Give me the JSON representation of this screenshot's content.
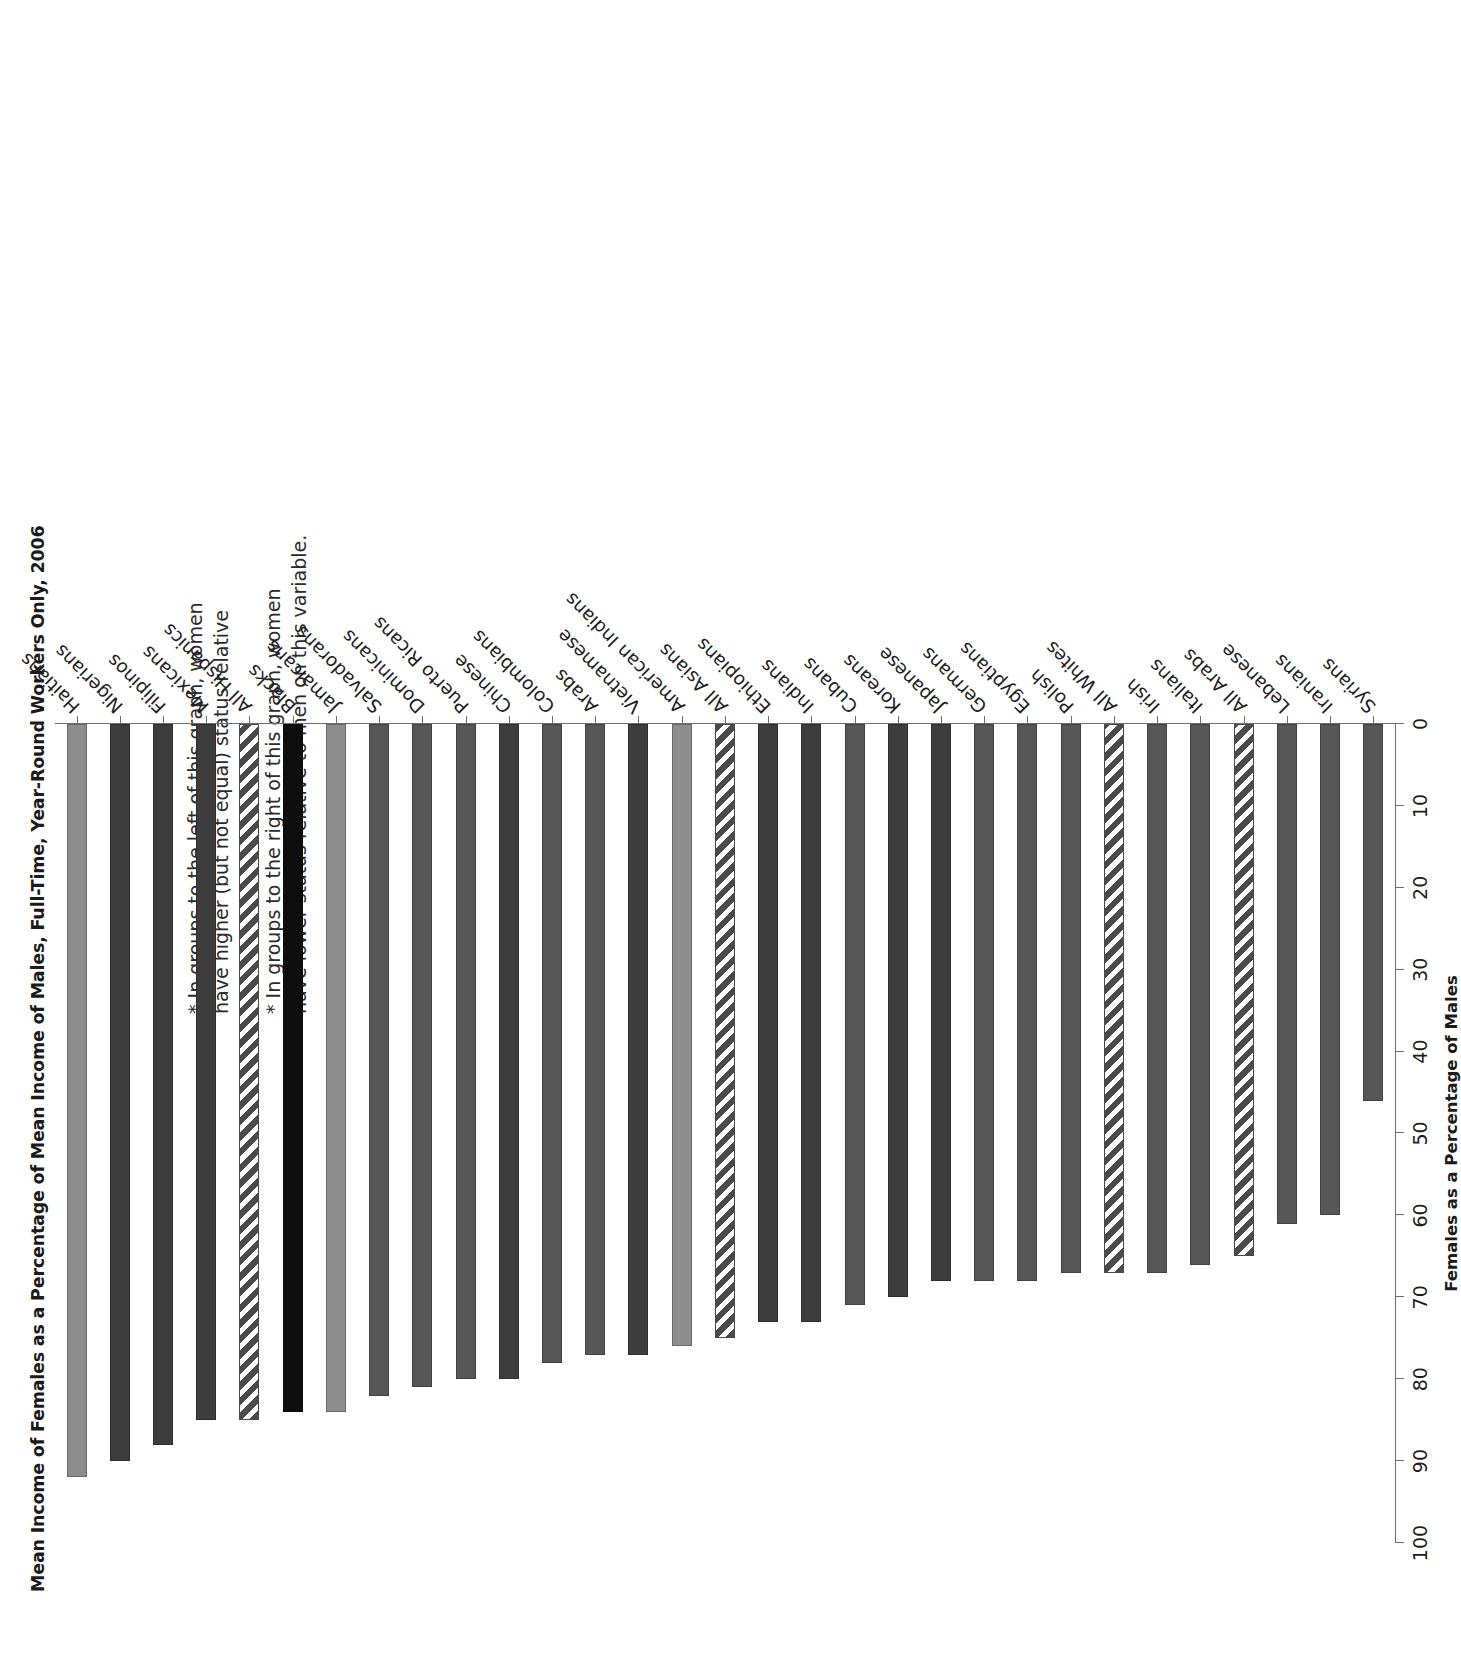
{
  "chart": {
    "title": "Mean Income of Females as a Percentage of Mean Income of Males, Full-Time, Year-Round Workers Only, 2006",
    "axis_title": "Females as a Percentage of Males",
    "note_lines": [
      "* In groups to the left of this graph, women",
      "have higher (but not equal) status relative",
      "to men on this variable.",
      "* In groups to the right of this graph, women",
      "have lower status relative to men on this variable."
    ]
  },
  "chart_data": {
    "type": "bar",
    "orientation": "horizontal",
    "title": "Mean Income of Females as a Percentage of Mean Income of Males, Full-Time, Year-Round Workers Only, 2006",
    "xlabel": "Females as a Percentage of Males",
    "ylabel": "",
    "ylim": [
      0,
      100
    ],
    "ticks": [
      100,
      90,
      80,
      70,
      60,
      50,
      40,
      30,
      20,
      10,
      0
    ],
    "grid": false,
    "legend": "none",
    "categories": [
      "Haitians",
      "Nigerians",
      "Filipinos",
      "Mexicans",
      "All Hispanics",
      "Blacks",
      "Jamaicans",
      "Salvadorans",
      "Dominicans",
      "Puerto Ricans",
      "Chinese",
      "Colombians",
      "Arabs",
      "Vietnamese",
      "American Indians",
      "All Asians",
      "Ethiopians",
      "Indians",
      "Cubans",
      "Koreans",
      "Japanese",
      "Germans",
      "Egyptians",
      "Polish",
      "All Whites",
      "Irish",
      "Italians",
      "All Arabs",
      "Lebanese",
      "Iranians",
      "Syrians"
    ],
    "values": [
      92,
      90,
      88,
      85,
      85,
      84,
      84,
      82,
      81,
      80,
      80,
      78,
      77,
      77,
      76,
      75,
      73,
      73,
      71,
      70,
      68,
      68,
      68,
      67,
      67,
      67,
      66,
      65,
      61,
      60,
      46
    ],
    "bar_styles": [
      "grey-light",
      "grey-dark",
      "grey-dark",
      "grey-dark",
      "hatch",
      "black",
      "grey-light",
      "grey-mid",
      "grey-mid",
      "grey-mid",
      "grey-dark",
      "grey-mid",
      "grey-mid",
      "grey-dark",
      "grey-light",
      "hatch",
      "grey-dark",
      "grey-dark",
      "grey-mid",
      "grey-dark",
      "grey-dark",
      "grey-mid",
      "grey-mid",
      "grey-mid",
      "hatch",
      "grey-mid",
      "grey-mid",
      "hatch",
      "grey-mid",
      "grey-mid",
      "grey-mid"
    ]
  },
  "colors": {
    "grey-light": "#8d8d8d",
    "grey-mid": "#575757",
    "grey-dark": "#3d3d3d",
    "black": "#0d0d0d",
    "hatch": "#4a4a4a",
    "axis": "#6f6f6f"
  }
}
